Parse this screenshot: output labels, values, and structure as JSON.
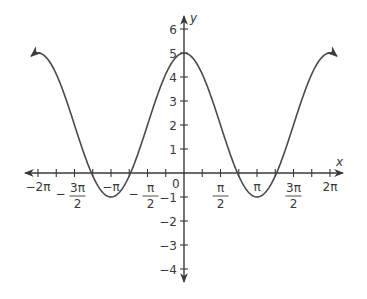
{
  "chart_data": {
    "type": "line",
    "title": "",
    "function": "y = 3cos(x) + 2",
    "xlabel": "x",
    "ylabel": "y",
    "xlim": [
      -6.6,
      6.6
    ],
    "ylim": [
      -4.5,
      6.5
    ],
    "grid": false,
    "legend": null,
    "x_ticks": [
      {
        "value": -6.2832,
        "label": "−2π",
        "num": "−2π",
        "den": ""
      },
      {
        "value": -4.7124,
        "label": "−3π/2",
        "num": "3π",
        "den": "2",
        "neg": true
      },
      {
        "value": -3.1416,
        "label": "−π",
        "num": "−π",
        "den": ""
      },
      {
        "value": -1.5708,
        "label": "−π/2",
        "num": "π",
        "den": "2",
        "neg": true
      },
      {
        "value": 1.5708,
        "label": "π/2",
        "num": "π",
        "den": "2"
      },
      {
        "value": 3.1416,
        "label": "π",
        "num": "π",
        "den": ""
      },
      {
        "value": 4.7124,
        "label": "3π/2",
        "num": "3π",
        "den": "2"
      },
      {
        "value": 6.2832,
        "label": "2π",
        "num": "2π",
        "den": ""
      }
    ],
    "x_minor_ticks_step": 0.7854,
    "y_ticks": [
      6,
      5,
      4,
      3,
      2,
      1,
      -1,
      -2,
      -3,
      -4
    ],
    "y_tick_labels": [
      "6",
      "5",
      "4",
      "3",
      "2",
      "1",
      "−1",
      "−2",
      "−3",
      "−4"
    ],
    "origin_label": "0",
    "series": [
      {
        "name": "3cos(x)+2",
        "x": [
          -6.6,
          -6.2832,
          -5.4978,
          -4.7124,
          -3.927,
          -3.1416,
          -2.3562,
          -1.5708,
          -0.7854,
          0,
          0.7854,
          1.5708,
          2.3562,
          3.1416,
          3.927,
          4.7124,
          5.4978,
          6.2832,
          6.6
        ],
        "y": [
          4.85,
          5,
          4.12,
          2,
          -0.12,
          -1,
          -0.12,
          2,
          4.12,
          5,
          4.12,
          2,
          -0.12,
          -1,
          -0.12,
          2,
          4.12,
          5,
          4.85
        ],
        "color": "#4a4a4a",
        "arrows_both_ends": true
      }
    ],
    "colors": {
      "axis": "#3a3a3a",
      "curve": "#4a4a4a",
      "background": "#ffffff"
    }
  }
}
